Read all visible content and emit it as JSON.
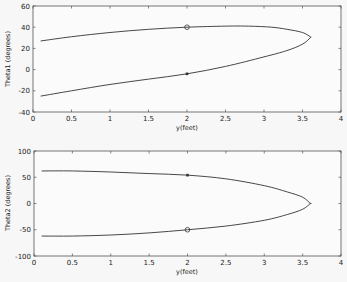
{
  "chart_data": [
    {
      "type": "line",
      "title": "",
      "xlabel": "y(feet)",
      "ylabel": "Theta1 (degrees)",
      "xlim": [
        0,
        4
      ],
      "ylim": [
        -40,
        60
      ],
      "xticks": [
        "0",
        "0.5",
        "1",
        "1.5",
        "2",
        "2.5",
        "3",
        "3.5",
        "4"
      ],
      "yticks": [
        "60",
        "40",
        "20",
        "0",
        "-20",
        "-40"
      ],
      "grid": false,
      "series": [
        {
          "name": "upper branch",
          "x": [
            0.1,
            0.5,
            1.0,
            1.5,
            2.0,
            2.5,
            2.8,
            3.1,
            3.3,
            3.5,
            3.6
          ],
          "y": [
            27,
            31,
            35,
            38,
            40,
            41,
            41,
            40,
            38,
            35,
            31
          ]
        },
        {
          "name": "lower branch",
          "x": [
            0.1,
            0.5,
            1.0,
            1.5,
            2.0,
            2.5,
            3.0,
            3.3,
            3.5,
            3.6
          ],
          "y": [
            -25,
            -20,
            -14,
            -9,
            -4,
            3,
            12,
            18,
            24,
            30
          ]
        }
      ],
      "markers": [
        {
          "shape": "circle",
          "x": 2.0,
          "y": 40
        },
        {
          "shape": "square",
          "x": 2.0,
          "y": -4
        }
      ]
    },
    {
      "type": "line",
      "title": "",
      "xlabel": "y(feet)",
      "ylabel": "Theta2 (degrees)",
      "xlim": [
        0,
        4
      ],
      "ylim": [
        -100,
        100
      ],
      "xticks": [
        "0",
        "0.5",
        "1",
        "1.5",
        "2",
        "2.5",
        "3",
        "3.5",
        "4"
      ],
      "yticks": [
        "100",
        "50",
        "0",
        "-50",
        "-100"
      ],
      "grid": false,
      "series": [
        {
          "name": "upper branch",
          "x": [
            0.1,
            0.5,
            1.0,
            1.5,
            2.0,
            2.5,
            3.0,
            3.3,
            3.5,
            3.6
          ],
          "y": [
            62,
            62,
            60,
            57,
            54,
            47,
            34,
            22,
            12,
            0
          ]
        },
        {
          "name": "lower branch",
          "x": [
            0.1,
            0.5,
            1.0,
            1.5,
            2.0,
            2.5,
            3.0,
            3.3,
            3.5,
            3.6
          ],
          "y": [
            -62,
            -62,
            -60,
            -56,
            -50,
            -43,
            -32,
            -21,
            -11,
            0
          ]
        }
      ],
      "markers": [
        {
          "shape": "square",
          "x": 2.0,
          "y": 54
        },
        {
          "shape": "circle",
          "x": 2.0,
          "y": -50
        }
      ]
    }
  ],
  "plots": {
    "top": {
      "ylabel": "Theta1 (degrees)",
      "xlabel": "y(feet)",
      "yticks": [
        "60",
        "40",
        "20",
        "0",
        "-20",
        "-40"
      ],
      "xticks": [
        "0",
        "0.5",
        "1",
        "1.5",
        "2",
        "2.5",
        "3",
        "3.5",
        "4"
      ]
    },
    "bottom": {
      "ylabel": "Theta2 (degrees)",
      "xlabel": "y(feet)",
      "yticks": [
        "100",
        "50",
        "0",
        "-50",
        "-100"
      ],
      "xticks": [
        "0",
        "0.5",
        "1",
        "1.5",
        "2",
        "2.5",
        "3",
        "3.5",
        "4"
      ]
    },
    "line_color": "#333333"
  }
}
